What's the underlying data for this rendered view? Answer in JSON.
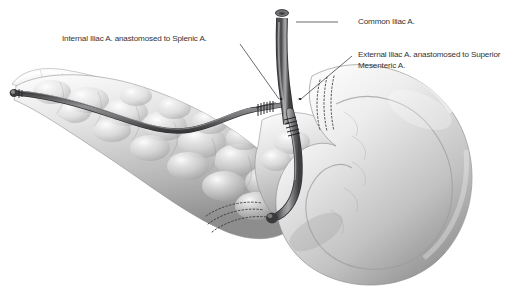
{
  "figure": {
    "type": "medical-illustration",
    "style": "grayscale airbrush anatomical drawing",
    "background_color": "#ffffff",
    "ink_color": "#333335",
    "width": 495,
    "height": 298
  },
  "labels": [
    {
      "id": "common-iliac",
      "text": "Common Iliac A.",
      "x": 358,
      "y": 16,
      "leader": {
        "x1": 338,
        "y1": 22,
        "x2": 296,
        "y2": 22,
        "style": "straight"
      }
    },
    {
      "id": "internal-iliac",
      "text": "Internal Iliac A. anastomosed to Splenic A.",
      "x": 62,
      "y": 33,
      "leader": {
        "x1": 240,
        "y1": 44,
        "x2": 279,
        "y2": 99,
        "style": "straight"
      }
    },
    {
      "id": "external-iliac",
      "text": "External Iliac A. anastomosed to Superior Mesenteric A.",
      "x": 358,
      "y": 49,
      "leader": {
        "x1": 352,
        "y1": 56,
        "x2": 301,
        "y2": 99,
        "style": "straight"
      }
    }
  ],
  "anatomy": {
    "pancreas": {
      "name": "pancreas",
      "position": "left-and-center",
      "tone": "light-gray lobulated"
    },
    "duodenum": {
      "name": "duodenal C-loop",
      "position": "right",
      "tone": "smooth light-gray"
    },
    "splenic_artery": {
      "name": "splenic-artery",
      "path": "along pancreatic tail to left stump"
    },
    "graft_trunk": {
      "name": "common-iliac-artery-graft",
      "position": "vertical center-top"
    }
  },
  "markers": {
    "anastomosis_bands": [
      {
        "id": "band-splenic",
        "label": "suture-ring"
      },
      {
        "id": "band-trunk",
        "label": "suture-ring"
      },
      {
        "id": "band-sma",
        "label": "suture-ring"
      }
    ],
    "staple_lines": [
      {
        "id": "staple-duodenum-upper",
        "label": "dashed-staple-line"
      },
      {
        "id": "staple-duodenum-lower",
        "label": "dashed-staple-line"
      }
    ],
    "vessel_stump": {
      "id": "ligated-stump",
      "label": "ligated-vessel-end"
    },
    "cut_lumen": {
      "id": "cut-lumen",
      "label": "open-vessel-lumen"
    }
  }
}
